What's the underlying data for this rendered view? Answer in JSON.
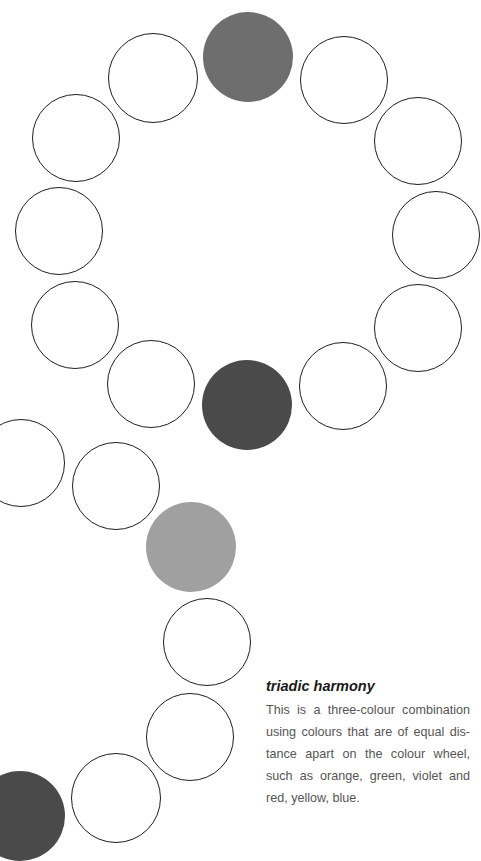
{
  "caption": {
    "title": "triadic harmony",
    "body": "This is a three-colour combination using colours that are of equal dis­tance apart on the colour wheel, such as orange, green, violet and red, yel­low, blue."
  },
  "circles": [
    {
      "id": "top-mid-gray",
      "cx": 248,
      "cy": 57,
      "r": 45,
      "fill": "#6e6e6e"
    },
    {
      "id": "ring-1",
      "cx": 344,
      "cy": 80,
      "r": 44,
      "fill": null
    },
    {
      "id": "ring-2",
      "cx": 418,
      "cy": 141,
      "r": 44,
      "fill": null
    },
    {
      "id": "ring-3",
      "cx": 436,
      "cy": 235,
      "r": 44,
      "fill": null
    },
    {
      "id": "ring-4",
      "cx": 418,
      "cy": 328,
      "r": 44,
      "fill": null
    },
    {
      "id": "ring-5",
      "cx": 343,
      "cy": 386,
      "r": 44,
      "fill": null
    },
    {
      "id": "ring-bottom-dark",
      "cx": 247,
      "cy": 405,
      "r": 45,
      "fill": "#4a4a4a"
    },
    {
      "id": "ring-7",
      "cx": 151,
      "cy": 384,
      "r": 44,
      "fill": null
    },
    {
      "id": "ring-8",
      "cx": 75,
      "cy": 325,
      "r": 44,
      "fill": null
    },
    {
      "id": "ring-9",
      "cx": 59,
      "cy": 231,
      "r": 44,
      "fill": null
    },
    {
      "id": "ring-10",
      "cx": 76,
      "cy": 138,
      "r": 44,
      "fill": null
    },
    {
      "id": "ring-11",
      "cx": 153,
      "cy": 78,
      "r": 45,
      "fill": null
    },
    {
      "id": "tail-1",
      "cx": 21,
      "cy": 463,
      "r": 44,
      "fill": null
    },
    {
      "id": "tail-2",
      "cx": 116,
      "cy": 486,
      "r": 44,
      "fill": null
    },
    {
      "id": "tail-light-gray",
      "cx": 191,
      "cy": 547,
      "r": 45,
      "fill": "#a0a0a0"
    },
    {
      "id": "tail-3",
      "cx": 207,
      "cy": 642,
      "r": 44,
      "fill": null
    },
    {
      "id": "tail-4",
      "cx": 190,
      "cy": 737,
      "r": 44,
      "fill": null
    },
    {
      "id": "tail-5",
      "cx": 116,
      "cy": 798,
      "r": 45,
      "fill": null
    },
    {
      "id": "tail-dark",
      "cx": 20,
      "cy": 816,
      "r": 45,
      "fill": "#4a4a4a"
    }
  ],
  "colors": {
    "stroke": "#1e1e1e",
    "medium_gray": "#6e6e6e",
    "dark_gray": "#4a4a4a",
    "light_gray": "#a0a0a0",
    "body_text": "#555555"
  }
}
